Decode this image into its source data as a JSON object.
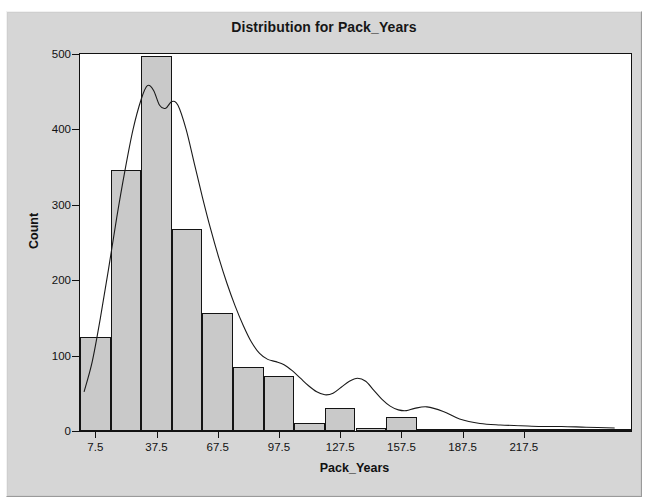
{
  "window": {
    "ghost_text_top": "",
    "background_color": "#d6d6d6",
    "frame_color": "#9a9a9a"
  },
  "chart_data": {
    "type": "bar",
    "title": "Distribution for Pack_Years",
    "xlabel": "Pack_Years",
    "ylabel": "Count",
    "grid": false,
    "legend": null,
    "bar_fill_color": "#c9c9c9",
    "bar_edge_color": "#141414",
    "curve_color": "#1a1a1a",
    "plot_background": "#ffffff",
    "bin_width": 15,
    "xlim": [
      0,
      270
    ],
    "ylim": [
      0,
      500
    ],
    "yticks": [
      0,
      100,
      200,
      300,
      400,
      500
    ],
    "ytick_labels": [
      "0",
      "100",
      "200",
      "300",
      "400",
      "500"
    ],
    "xticks": [
      7.5,
      37.5,
      67.5,
      97.5,
      127.5,
      157.5,
      187.5,
      217.5
    ],
    "xtick_labels": [
      "7.5",
      "37.5",
      "67.5",
      "97.5",
      "127.5",
      "157.5",
      "187.5",
      "217.5"
    ],
    "bin_centers": [
      7.5,
      22.5,
      37.5,
      52.5,
      67.5,
      82.5,
      97.5,
      112.5,
      127.5,
      142.5,
      157.5,
      172.5,
      187.5,
      202.5,
      217.5,
      232.5,
      247.5,
      262.5
    ],
    "categories": [
      "0-15",
      "15-30",
      "30-45",
      "45-60",
      "60-75",
      "75-90",
      "90-105",
      "105-120",
      "120-135",
      "135-150",
      "150-165",
      "165-180",
      "180-195",
      "195-210",
      "210-225",
      "225-240",
      "240-255",
      "255-270"
    ],
    "values": [
      125,
      346,
      497,
      268,
      156,
      85,
      73,
      10,
      30,
      4,
      19,
      0,
      0,
      3,
      3,
      0,
      0,
      0
    ],
    "density_curve": {
      "name": "Kernel density",
      "x": [
        2,
        6,
        10,
        14,
        18,
        22,
        26,
        30,
        33,
        36,
        39,
        42,
        45,
        48,
        52,
        56,
        60,
        64,
        68,
        72,
        76,
        80,
        84,
        88,
        92,
        96,
        100,
        104,
        108,
        112,
        116,
        120,
        124,
        128,
        132,
        136,
        140,
        144,
        148,
        152,
        156,
        160,
        164,
        170,
        178,
        186,
        196,
        206,
        216,
        226,
        236,
        248,
        262
      ],
      "y": [
        52,
        92,
        150,
        215,
        283,
        345,
        400,
        440,
        458,
        452,
        432,
        428,
        437,
        432,
        400,
        355,
        310,
        268,
        230,
        196,
        166,
        140,
        118,
        103,
        95,
        92,
        88,
        80,
        70,
        60,
        52,
        48,
        50,
        58,
        66,
        70,
        66,
        54,
        42,
        33,
        28,
        27,
        30,
        32,
        26,
        16,
        10,
        8,
        7,
        6,
        6,
        5,
        4
      ]
    }
  }
}
